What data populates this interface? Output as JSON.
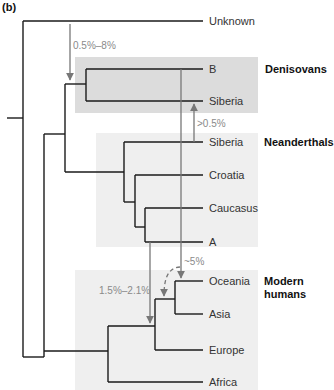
{
  "figure": {
    "panel_label": "(b)",
    "type": "phylogenetic-tree",
    "colors": {
      "branch": "#1a1a1a",
      "arrow": "#777777",
      "box_dark": "#dcdcdc",
      "box_light": "#efefef",
      "pct_text": "#8a8a8a"
    },
    "leaves": [
      {
        "label": "Unknown"
      },
      {
        "label": "B"
      },
      {
        "label": "Siberia"
      },
      {
        "label": "Siberia"
      },
      {
        "label": "Croatia"
      },
      {
        "label": "Caucasus"
      },
      {
        "label": "A"
      },
      {
        "label": "Oceania"
      },
      {
        "label": "Asia"
      },
      {
        "label": "Europe"
      },
      {
        "label": "Africa"
      }
    ],
    "groups": [
      {
        "label": "Denisovans",
        "members": [
          "B",
          "Siberia"
        ]
      },
      {
        "label": "Neanderthals",
        "members": [
          "Siberia",
          "Croatia",
          "Caucasus",
          "A"
        ]
      },
      {
        "label": "Modern humans",
        "line1": "Modern",
        "line2": "humans",
        "members": [
          "Oceania",
          "Asia",
          "Europe",
          "Africa"
        ]
      }
    ],
    "gene_flow": [
      {
        "label": "0.5%–8%",
        "from": "Unknown",
        "to": "Denisovan-Neanderthal ancestor"
      },
      {
        "label": ">0.5%",
        "from": "Neanderthal Siberia",
        "to": "Denisovan Siberia"
      },
      {
        "label": "~5%",
        "from": "Denisovan B",
        "to": "Oceania"
      },
      {
        "label": "1.5%–2.1%",
        "from": "Neanderthal A",
        "to": "Non-African modern humans"
      },
      {
        "label": "",
        "from": "Denisovan/Neanderthal",
        "to": "Asia-Oceania ancestor",
        "style": "dashed"
      }
    ]
  }
}
